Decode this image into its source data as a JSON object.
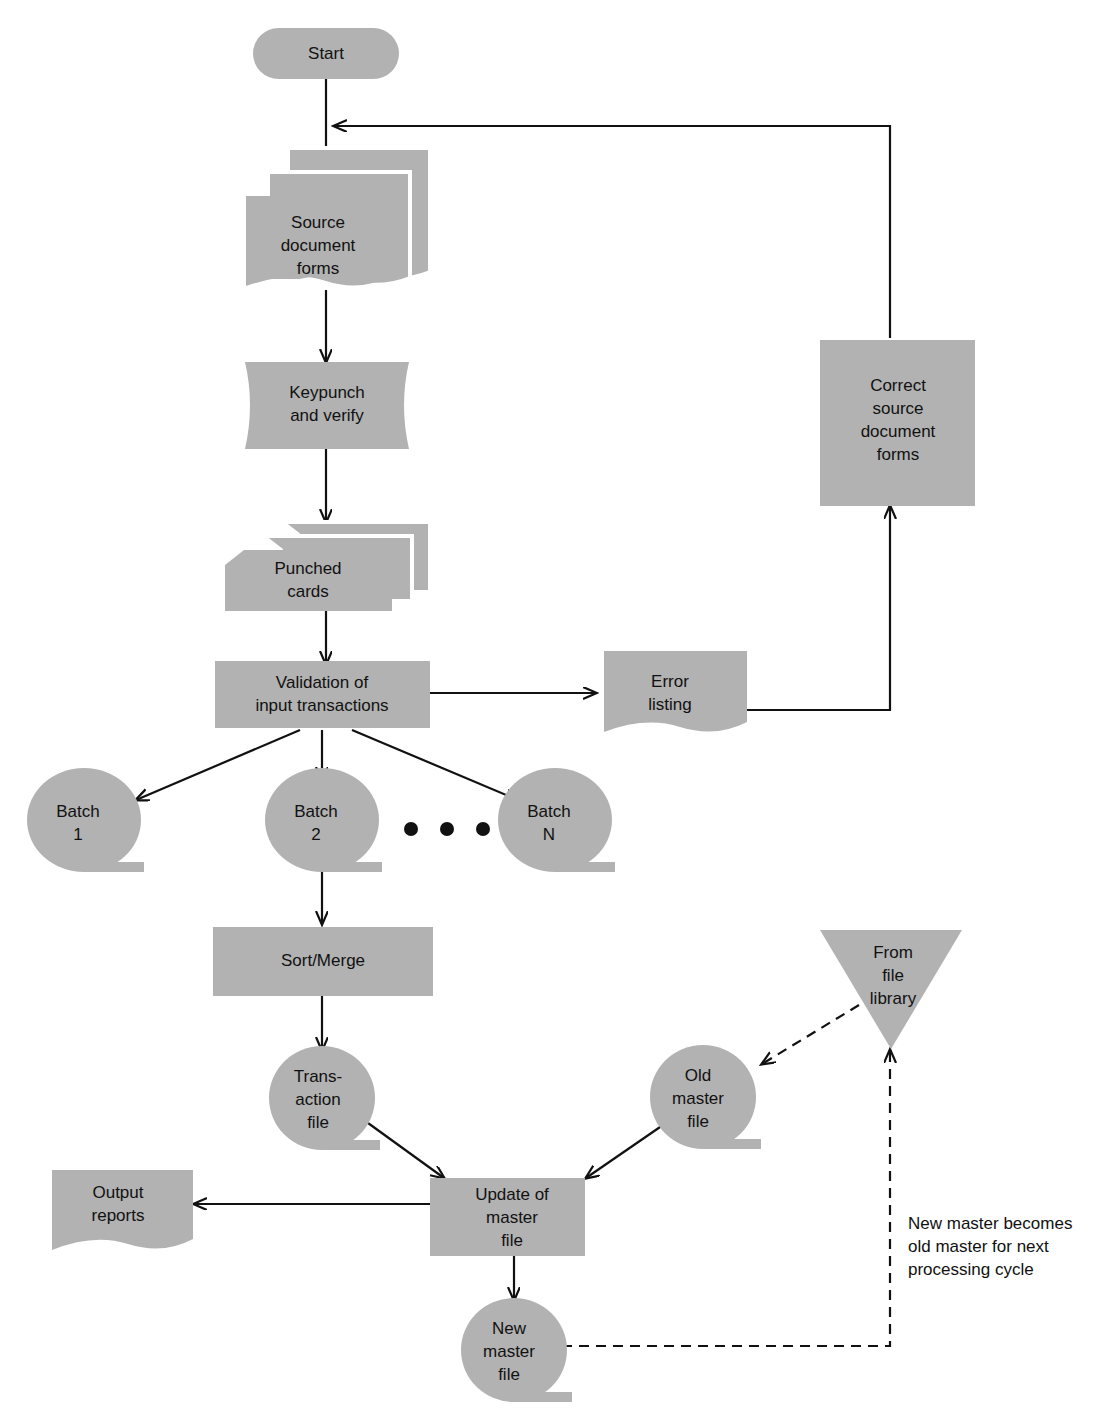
{
  "diagram": {
    "fill_color": "#b2b2b2",
    "line_color": "#111111",
    "background": "#ffffff"
  },
  "nodes": {
    "start": {
      "label": "Start",
      "shape": "terminator"
    },
    "source_forms": {
      "line1": "Source",
      "line2": "document",
      "line3": "forms",
      "shape": "document-stack"
    },
    "keypunch": {
      "line1": "Keypunch",
      "line2": "and verify",
      "shape": "manual-operation"
    },
    "punched_cards": {
      "line1": "Punched",
      "line2": "cards",
      "shape": "punched-card-stack"
    },
    "validation": {
      "line1": "Validation of",
      "line2": "input transactions",
      "shape": "process"
    },
    "error_listing": {
      "line1": "Error",
      "line2": "listing",
      "shape": "document"
    },
    "correct_forms": {
      "line1": "Correct",
      "line2": "source",
      "line3": "document",
      "line4": "forms",
      "shape": "process"
    },
    "batch1": {
      "line1": "Batch",
      "line2": "1",
      "shape": "magnetic-tape"
    },
    "batch2": {
      "line1": "Batch",
      "line2": "2",
      "shape": "magnetic-tape"
    },
    "batchN": {
      "line1": "Batch",
      "line2": "N",
      "shape": "magnetic-tape"
    },
    "sort_merge": {
      "label": "Sort/Merge",
      "shape": "process"
    },
    "transaction_file": {
      "line1": "Trans-",
      "line2": "action",
      "line3": "file",
      "shape": "magnetic-tape"
    },
    "old_master": {
      "line1": "Old",
      "line2": "master",
      "line3": "file",
      "shape": "magnetic-tape"
    },
    "from_library": {
      "line1": "From",
      "line2": "file",
      "line3": "library",
      "shape": "offpage-triangle"
    },
    "update_master": {
      "line1": "Update of",
      "line2": "master",
      "line3": "file",
      "shape": "process"
    },
    "output_reports": {
      "line1": "Output",
      "line2": "reports",
      "shape": "document"
    },
    "new_master": {
      "line1": "New",
      "line2": "master",
      "line3": "file",
      "shape": "magnetic-tape"
    }
  },
  "annotations": {
    "ellipsis": "• • •",
    "recycle_note_line1": "New master becomes",
    "recycle_note_line2": "old master for next",
    "recycle_note_line3": "processing cycle"
  }
}
